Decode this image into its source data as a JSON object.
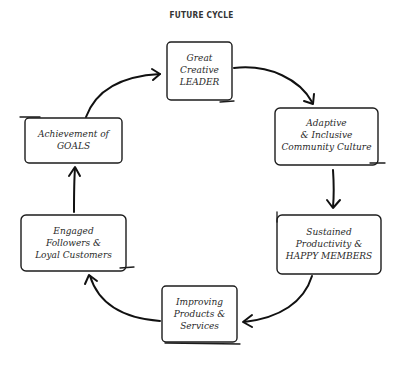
{
  "title": "FUTURE CYCLE",
  "nodes": [
    {
      "id": "leader",
      "lines": [
        "Great",
        "Creative",
        "LEADER"
      ]
    },
    {
      "id": "culture",
      "lines": [
        "Adaptive",
        "& Inclusive",
        "Community Culture"
      ]
    },
    {
      "id": "productivity",
      "lines": [
        "Sustained",
        "Productivity &",
        "HAPPY MEMBERS"
      ]
    },
    {
      "id": "products",
      "lines": [
        "Improving",
        "Products &",
        "Services"
      ]
    },
    {
      "id": "followers",
      "lines": [
        "Engaged",
        "Followers &",
        "Loyal Customers"
      ]
    },
    {
      "id": "goals",
      "lines": [
        "Achievement of",
        "GOALS"
      ]
    }
  ],
  "edges": [
    {
      "from": "leader",
      "to": "culture"
    },
    {
      "from": "culture",
      "to": "productivity"
    },
    {
      "from": "productivity",
      "to": "products"
    },
    {
      "from": "products",
      "to": "followers"
    },
    {
      "from": "followers",
      "to": "goals"
    },
    {
      "from": "goals",
      "to": "leader"
    }
  ],
  "colors": {
    "ink": "#1c1c1c",
    "background": "#ffffff"
  }
}
